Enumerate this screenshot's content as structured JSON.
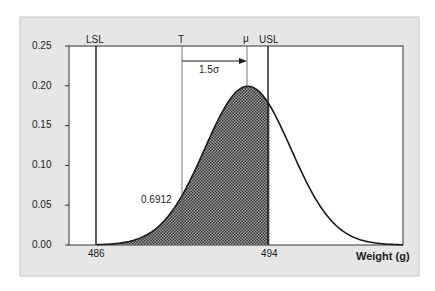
{
  "chart_data": {
    "type": "area",
    "title": "",
    "xlabel": "Weight (g)",
    "ylabel": "",
    "distribution": "normal",
    "mean": 493,
    "sigma": 2,
    "xlim": [
      484.7,
      500.2
    ],
    "ylim": [
      0,
      0.25
    ],
    "yticks": [
      "0.00",
      "0.05",
      "0.10",
      "0.15",
      "0.20",
      "0.25"
    ],
    "xtick_labels": [
      {
        "x": 486,
        "label": "486"
      },
      {
        "x": 494,
        "label": "494"
      }
    ],
    "reference_lines": [
      {
        "name": "LSL",
        "x": 486
      },
      {
        "name": "T",
        "x": 490
      },
      {
        "name": "μ",
        "x": 493
      },
      {
        "name": "USL",
        "x": 494
      }
    ],
    "shaded_region": {
      "from": 486,
      "to": 494,
      "area": "0.6912"
    },
    "annotations": [
      {
        "text": "1.5σ",
        "type": "arrow",
        "from": 490,
        "to": 493
      },
      {
        "text": "0.6912",
        "type": "label"
      }
    ],
    "grid": false,
    "legend": "none"
  },
  "labels": {
    "lsl": "LSL",
    "t": "T",
    "mu": "μ",
    "usl": "USL",
    "shift": "1.5σ",
    "area": "0.6912",
    "xlabel": "Weight (g)",
    "x486": "486",
    "x494": "494",
    "y0": "0.00",
    "y1": "0.05",
    "y2": "0.10",
    "y3": "0.15",
    "y4": "0.20",
    "y5": "0.25"
  },
  "colors": {
    "frame_bg": "#e6e6e6",
    "plot_bg": "#ffffff",
    "line": "#1a1a1a",
    "hatch": "#555555"
  }
}
